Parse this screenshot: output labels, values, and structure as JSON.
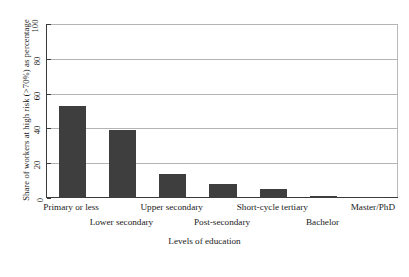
{
  "chart_data": {
    "type": "bar",
    "title": "",
    "xlabel": "Levels of education",
    "ylabel": "Share of workers at high risk (>70%) as percentage",
    "categories": [
      "Primary or less",
      "Lower secondary",
      "Upper secondary",
      "Post-secondary",
      "Short-cycle tertiary",
      "Bachelor",
      "Master/PhD"
    ],
    "values": [
      53,
      39,
      14,
      8,
      5,
      1,
      0.5
    ],
    "ylim": [
      0,
      100
    ],
    "yticks": [
      0,
      20,
      40,
      60,
      80,
      100
    ],
    "ytick_labels": [
      "0",
      "20",
      "40",
      "60",
      "80",
      "100"
    ],
    "grid": true,
    "legend": "none",
    "bar_color": "#3e3e3e",
    "grid_color": "#b4b4b4",
    "axis_color": "#3a3a3a",
    "label_rows": [
      0,
      1,
      0,
      1,
      0,
      1,
      0
    ]
  }
}
